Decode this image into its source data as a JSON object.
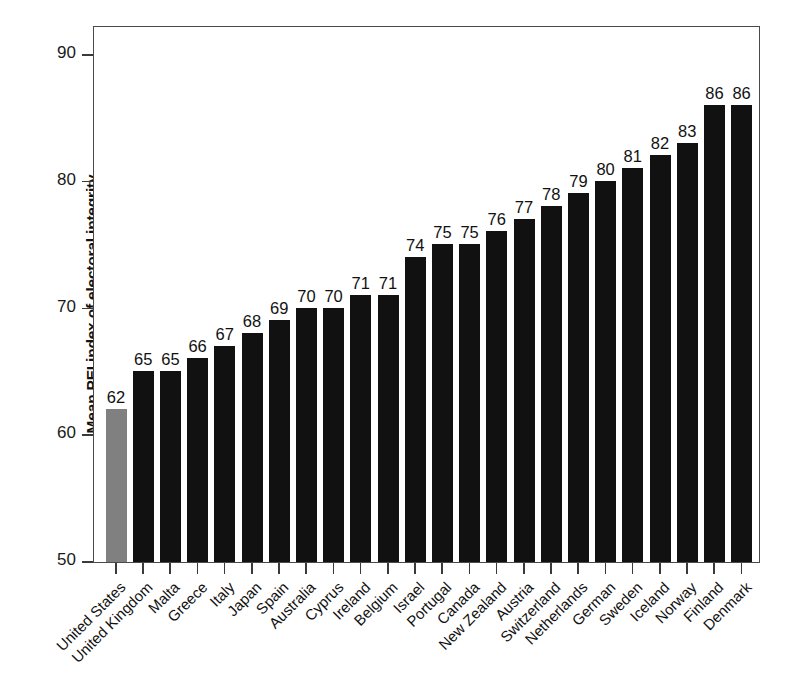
{
  "chart_data": {
    "type": "bar",
    "title": "",
    "xlabel": "",
    "ylabel": "Mean PEI index of electoral integrity",
    "ylim": [
      50,
      90
    ],
    "yticks": [
      50,
      60,
      70,
      80,
      90
    ],
    "grid": false,
    "legend": "none",
    "highlight_color": "#808080",
    "bar_color": "#111111",
    "highlight_category": "United States",
    "categories": [
      "United States",
      "United Kingdom",
      "Malta",
      "Greece",
      "Italy",
      "Japan",
      "Spain",
      "Australia",
      "Cyprus",
      "Ireland",
      "Belgium",
      "Israel",
      "Portugal",
      "Canada",
      "New Zealand",
      "Austria",
      "Switzerland",
      "Netherlands",
      "German",
      "Sweden",
      "Iceland",
      "Norway",
      "Finland",
      "Denmark"
    ],
    "values": [
      62,
      65,
      65,
      66,
      67,
      68,
      69,
      70,
      70,
      71,
      71,
      74,
      75,
      75,
      76,
      77,
      78,
      79,
      80,
      81,
      82,
      83,
      86,
      86
    ],
    "value_labels": [
      "62",
      "65",
      "65",
      "66",
      "67",
      "68",
      "69",
      "70",
      "70",
      "71",
      "71",
      "74",
      "75",
      "75",
      "76",
      "77",
      "78",
      "79",
      "80",
      "81",
      "82",
      "83",
      "86",
      "86"
    ],
    "ytick_labels": [
      "50",
      "60",
      "70",
      "80",
      "90"
    ]
  }
}
